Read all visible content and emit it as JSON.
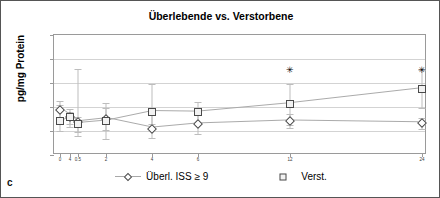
{
  "panel": {
    "label": "c"
  },
  "chart_data": {
    "type": "line",
    "title": "Überlebende vs. Verstorbene",
    "xlabel": "",
    "ylabel": "pg/mg Protein",
    "ylim": [
      0,
      10
    ],
    "yticks": [
      0,
      2,
      4,
      6,
      8,
      10
    ],
    "grid": true,
    "legend_position": "bottom",
    "x_positions": [
      0,
      0.25,
      0.5,
      2,
      4,
      6,
      12,
      24
    ],
    "categories": [
      "0",
      "4",
      "0.5",
      "2",
      "4",
      "6",
      "12",
      "24"
    ],
    "series": [
      {
        "name": "Überl. ISS ≥ 9",
        "marker": "diamond",
        "values": [
          3.75,
          3.2,
          2.75,
          3.0,
          2.2,
          2.55,
          2.8,
          2.65
        ],
        "err_low": [
          3.0,
          2.6,
          1.55,
          1.3,
          1.4,
          1.75,
          2.25,
          2.2
        ],
        "err_high": [
          4.5,
          3.8,
          7.2,
          4.3,
          3.3,
          3.5,
          3.4,
          3.1
        ]
      },
      {
        "name": "Verst.",
        "marker": "square",
        "values": [
          2.8,
          3.15,
          2.6,
          2.8,
          3.6,
          3.55,
          4.25,
          5.5
        ],
        "err_low": [
          2.0,
          2.35,
          1.9,
          2.1,
          2.55,
          2.6,
          2.5,
          3.9
        ],
        "err_high": [
          4.2,
          3.6,
          3.2,
          3.9,
          5.9,
          4.4,
          5.95,
          7.1
        ]
      }
    ],
    "annotations": [
      {
        "symbol": "✳",
        "x": 12,
        "y": 7.1
      },
      {
        "symbol": "✳",
        "x": 24,
        "y": 7.1
      }
    ]
  },
  "legend": {
    "items": [
      {
        "label": "Überl. ISS ≥ 9"
      },
      {
        "label": "Verst."
      }
    ]
  },
  "ytick_labels": [
    "10",
    "8",
    "6",
    "4",
    "2",
    "0"
  ]
}
